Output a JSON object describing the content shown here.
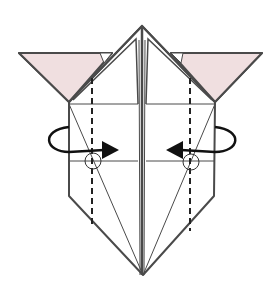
{
  "diagram": {
    "type": "origami-fold-instruction",
    "colors": {
      "background": "#ffffff",
      "line": "#4a4a4a",
      "flap_fill": "#f0dfe0",
      "arrow": "#111111"
    },
    "elements": {
      "left_flap": "pink triangular flap (colored side) at upper left",
      "right_flap": "pink triangular flap (colored side) at upper right",
      "body": "white pentagonal body with central vertical crease, pointed top and bottom",
      "valley_folds": "two vertical dashed valley-fold lines",
      "reference_circles": "two small circles marking fold reference points",
      "arrows": "two curved rotation arrows pointing inward (fold behind / rotate)"
    }
  }
}
